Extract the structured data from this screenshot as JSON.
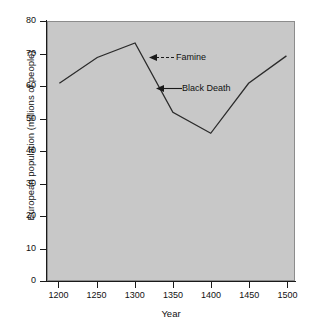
{
  "chart_data": {
    "type": "line",
    "title": "",
    "xlabel": "Year",
    "ylabel": "European population (millions of people)",
    "x": [
      1200,
      1250,
      1300,
      1350,
      1400,
      1450,
      1500
    ],
    "values": [
      61,
      69,
      73.5,
      52,
      45.5,
      61,
      69.5
    ],
    "xlim": [
      1185,
      1510
    ],
    "ylim": [
      0,
      80
    ],
    "xticks": [
      1200,
      1250,
      1300,
      1350,
      1400,
      1450,
      1500
    ],
    "yticks": [
      0,
      10,
      20,
      30,
      40,
      50,
      60,
      70,
      80
    ],
    "xtick_labels": [
      "1200",
      "1250",
      "1300",
      "1350",
      "1400",
      "1450",
      "1500"
    ],
    "ytick_labels": [
      "0",
      "10",
      "20",
      "30",
      "40",
      "50",
      "60",
      "70",
      "80"
    ],
    "grid": false,
    "legend": "none",
    "plot_background": "#c8c8c8",
    "line_color": "#2b2b2b",
    "annotations": [
      {
        "label": "Famine",
        "target_x": 1314,
        "target_y": 67.5,
        "arrow": "left"
      },
      {
        "label": "Black Death",
        "target_x": 1331,
        "target_y": 58.5,
        "arrow": "left"
      }
    ]
  },
  "axes": {
    "x_title": "Year",
    "y_title": "European population (millions of people)"
  }
}
